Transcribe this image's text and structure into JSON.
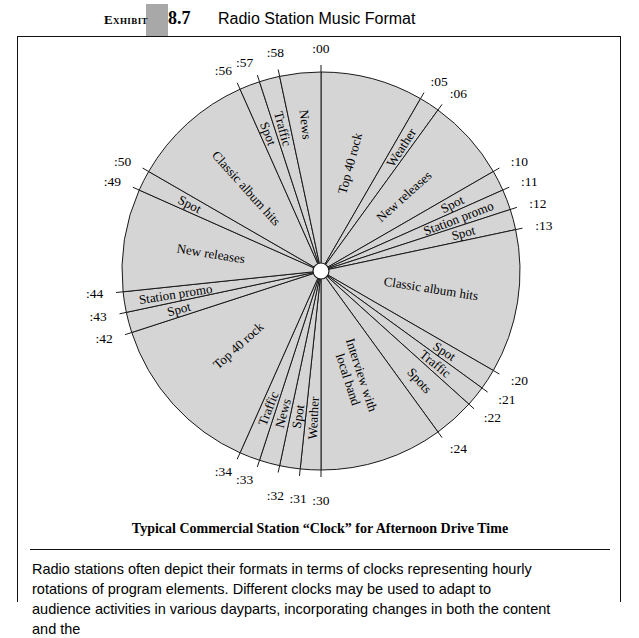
{
  "header": {
    "exhibit_word": "Exhibit",
    "exhibit_number": "8.7",
    "title": "Radio Station Music Format"
  },
  "body": {
    "paragraph": "Radio stations often depict their formats in terms of clocks representing hourly rotations of program elements. Different clocks may be used to adapt to audience activities in various dayparts, incorporating changes in both the content and the"
  },
  "chart_data": {
    "type": "pie",
    "title": "Typical Commercial Station “Clock” for Afternoon Drive Time",
    "subtitle": "",
    "xlabel": "",
    "ylabel": "",
    "units": "minutes",
    "total_minutes": 60,
    "legend_position": "none",
    "grid": false,
    "fill_color": "#d5d5d5",
    "stroke_color": "#1a1a1a",
    "start_angle_deg": 0,
    "direction": "clockwise",
    "tick_labels": [
      ":00",
      ":05",
      ":06",
      ":10",
      ":11",
      ":12",
      ":13",
      ":20",
      ":21",
      ":22",
      ":24",
      ":30",
      ":31",
      ":32",
      ":33",
      ":34",
      ":42",
      ":43",
      ":44",
      ":49",
      ":50",
      ":56",
      ":57",
      ":58"
    ],
    "categories": [
      "Top 40 rock",
      "Weather",
      "New releases",
      "Spot",
      "Station promo",
      "Spot",
      "Classic album hits",
      "Spot",
      "Traffic",
      "Spots",
      "Interview with local band",
      "Weather",
      "Spot",
      "News",
      "Traffic",
      "Top 40 rock",
      "Spot",
      "Station promo",
      "New releases",
      "Spot",
      "Classic album hits",
      "Spot",
      "Traffic",
      "News"
    ],
    "values": [
      5,
      1,
      4,
      1,
      1,
      1,
      7,
      1,
      1,
      2,
      6,
      1,
      1,
      1,
      1,
      8,
      1,
      1,
      5,
      1,
      6,
      1,
      1,
      2
    ],
    "segments": [
      {
        "start": ":00",
        "end": ":05",
        "label": "Top 40 rock",
        "minutes": 5
      },
      {
        "start": ":05",
        "end": ":06",
        "label": "Weather",
        "minutes": 1
      },
      {
        "start": ":06",
        "end": ":10",
        "label": "New releases",
        "minutes": 4
      },
      {
        "start": ":10",
        "end": ":11",
        "label": "Spot",
        "minutes": 1
      },
      {
        "start": ":11",
        "end": ":12",
        "label": "Station promo",
        "minutes": 1
      },
      {
        "start": ":12",
        "end": ":13",
        "label": "Spot",
        "minutes": 1
      },
      {
        "start": ":13",
        "end": ":20",
        "label": "Classic album hits",
        "minutes": 7
      },
      {
        "start": ":20",
        "end": ":21",
        "label": "Spot",
        "minutes": 1
      },
      {
        "start": ":21",
        "end": ":22",
        "label": "Traffic",
        "minutes": 1
      },
      {
        "start": ":22",
        "end": ":24",
        "label": "Spots",
        "minutes": 2
      },
      {
        "start": ":24",
        "end": ":30",
        "label": "Interview with local band",
        "minutes": 6
      },
      {
        "start": ":30",
        "end": ":31",
        "label": "Weather",
        "minutes": 1
      },
      {
        "start": ":31",
        "end": ":32",
        "label": "Spot",
        "minutes": 1
      },
      {
        "start": ":32",
        "end": ":33",
        "label": "News",
        "minutes": 1
      },
      {
        "start": ":33",
        "end": ":34",
        "label": "Traffic",
        "minutes": 1
      },
      {
        "start": ":34",
        "end": ":42",
        "label": "Top 40 rock",
        "minutes": 8
      },
      {
        "start": ":42",
        "end": ":43",
        "label": "Spot",
        "minutes": 1
      },
      {
        "start": ":43",
        "end": ":44",
        "label": "Station promo",
        "minutes": 1
      },
      {
        "start": ":44",
        "end": ":49",
        "label": "New releases",
        "minutes": 5
      },
      {
        "start": ":49",
        "end": ":50",
        "label": "Spot",
        "minutes": 1
      },
      {
        "start": ":50",
        "end": ":56",
        "label": "Classic album hits",
        "minutes": 6
      },
      {
        "start": ":56",
        "end": ":57",
        "label": "Spot",
        "minutes": 1
      },
      {
        "start": ":57",
        "end": ":58",
        "label": "Traffic",
        "minutes": 1
      },
      {
        "start": ":58",
        "end": ":00",
        "label": "News",
        "minutes": 2
      }
    ]
  }
}
